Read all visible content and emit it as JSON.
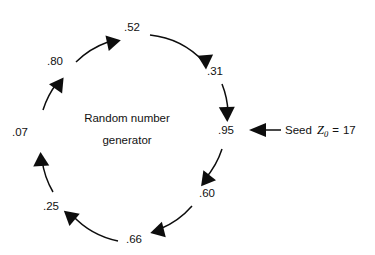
{
  "diagram": {
    "center_label": {
      "line1": "Random number",
      "line2": "generator"
    },
    "accent_color": "#0d0d0d",
    "background_color": "#ffffff",
    "geometry": {
      "center_x": 127,
      "center_y": 127,
      "radius": 86
    },
    "nodes": [
      {
        "id": "n95",
        "value": ".95",
        "angle_deg": 0,
        "x": 226,
        "y": 134,
        "anchor": "middle"
      },
      {
        "id": "n60",
        "value": ".60",
        "angle_deg": 45,
        "x": 207,
        "y": 197,
        "anchor": "middle"
      },
      {
        "id": "n66",
        "value": ".66",
        "angle_deg": 90,
        "x": 134,
        "y": 243,
        "anchor": "middle"
      },
      {
        "id": "n25",
        "value": ".25",
        "angle_deg": 135,
        "x": 51,
        "y": 210,
        "anchor": "middle"
      },
      {
        "id": "n07",
        "value": ".07",
        "angle_deg": 180,
        "x": 20,
        "y": 136,
        "anchor": "middle"
      },
      {
        "id": "n80",
        "value": ".80",
        "angle_deg": 225,
        "x": 55,
        "y": 65,
        "anchor": "middle"
      },
      {
        "id": "n52",
        "value": ".52",
        "angle_deg": 270,
        "x": 132,
        "y": 31,
        "anchor": "middle"
      },
      {
        "id": "n31",
        "value": ".31",
        "angle_deg": 315,
        "x": 215,
        "y": 75,
        "anchor": "middle"
      }
    ],
    "flow_direction": "clockwise",
    "seed": {
      "label": "Seed",
      "variable": "Z",
      "subscript": "0",
      "equals": "=",
      "value": "17",
      "arrow_direction": "left",
      "target_node": ".95"
    }
  }
}
